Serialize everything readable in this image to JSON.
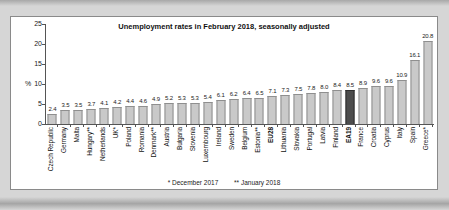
{
  "chart": {
    "title": "Unemployment rates in February 2018, seasonally adjusted",
    "unit_label": "%",
    "footnotes": [
      "* December 2017",
      "** January 2018"
    ],
    "colors": {
      "background_outer": "#d6d6d6",
      "panel": "#ffffff",
      "panel_border": "#8a8a8a",
      "bar": "#c9c9c9",
      "bar_border": "#8f8f8f",
      "highlight_bar": "#4d4d4d",
      "highlight_bar_border": "#2e2e2e",
      "axis": "#555555",
      "text": "#111111"
    }
  },
  "chart_data": {
    "type": "bar",
    "title": "Unemployment rates in February 2018, seasonally adjusted",
    "xlabel": "",
    "ylabel": "%",
    "ylim": [
      0,
      25
    ],
    "yticks": [
      25,
      20,
      15,
      10,
      5,
      0
    ],
    "grid": false,
    "legend": false,
    "footnotes": [
      "* December 2017",
      "** January 2018"
    ],
    "categories": [
      "Czech Republic",
      "Germany",
      "Malta",
      "Hungary**",
      "Netherlands",
      "UK*",
      "Poland",
      "Romania",
      "Denmark**",
      "Austria",
      "Bulgaria",
      "Slovenia",
      "Luxembourg",
      "Ireland",
      "Sweden",
      "Belgium",
      "Estonia**",
      "EU28",
      "Lithuania",
      "Slovakia",
      "Portugal",
      "Latvia",
      "Finland",
      "EA19",
      "France",
      "Croatia",
      "Cyprus",
      "Italy",
      "Spain",
      "Greece*"
    ],
    "values": [
      2.4,
      3.5,
      3.5,
      3.7,
      4.1,
      4.2,
      4.4,
      4.6,
      4.9,
      5.2,
      5.3,
      5.3,
      5.4,
      6.1,
      6.2,
      6.4,
      6.5,
      7.1,
      7.3,
      7.5,
      7.8,
      8.0,
      8.4,
      8.5,
      8.9,
      9.6,
      9.6,
      10.9,
      16.1,
      20.8
    ],
    "highlighted_category": "EA19",
    "bold_categories": [
      "EU28",
      "EA19"
    ]
  }
}
